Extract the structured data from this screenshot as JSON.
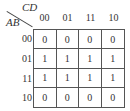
{
  "kmap": {
    "row_variable": "AB",
    "col_variable": "CD",
    "col_headers": [
      "00",
      "01",
      "11",
      "10"
    ],
    "row_headers": [
      "00",
      "01",
      "11",
      "10"
    ],
    "cells": [
      [
        "0",
        "0",
        "0",
        "0"
      ],
      [
        "1",
        "1",
        "1",
        "1"
      ],
      [
        "1",
        "1",
        "1",
        "1"
      ],
      [
        "0",
        "0",
        "0",
        "0"
      ]
    ]
  }
}
